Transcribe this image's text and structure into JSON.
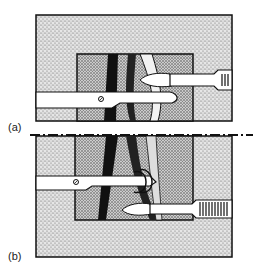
{
  "figure": {
    "panels": [
      {
        "label": "(a)"
      },
      {
        "label": "(b)"
      }
    ],
    "colors": {
      "ink": "#111111",
      "paper": "#ffffff",
      "stipple": "#8a8a8a",
      "stipple_light": "#cfcfcf"
    }
  }
}
